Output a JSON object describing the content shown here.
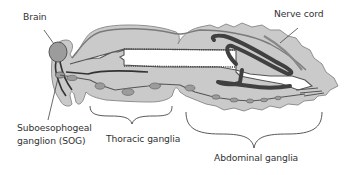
{
  "diagram": {
    "labels": {
      "brain": "Brain",
      "nerve_cord": "Nerve cord",
      "sog_line1": "Suboesophogeal",
      "sog_line2": "ganglion (SOG)",
      "thoracic": "Thoracic ganglia",
      "abdominal": "Abdominal ganglia"
    },
    "colors": {
      "body_fill": "#c8c8c8",
      "body_outline": "#8a8a8a",
      "ganglion_fill": "#999999",
      "nerve_stroke": "#555555",
      "gut_dark": "#444444",
      "label_text": "#333333",
      "background": "#ffffff"
    }
  }
}
